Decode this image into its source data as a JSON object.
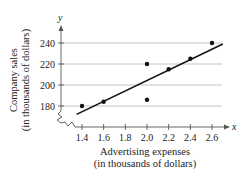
{
  "chart_data": {
    "type": "scatter",
    "title": "",
    "xlabel": "Advertising expenses",
    "xlabel_sub": "(in thousands of dollars)",
    "ylabel": "Company sales",
    "ylabel_sub": "(in thousands of dollars)",
    "x_axis_symbol": "x",
    "y_axis_symbol": "y",
    "x_ticks": [
      1.4,
      1.6,
      1.8,
      2.0,
      2.2,
      2.4,
      2.6
    ],
    "x_tick_labels": [
      "1.4",
      "1.6",
      "1.8",
      "2.0",
      "2.2",
      "2.4",
      "2.6"
    ],
    "y_ticks": [
      180,
      200,
      220,
      240
    ],
    "y_tick_labels": [
      "180",
      "200",
      "220",
      "240"
    ],
    "xlim": [
      1.2,
      2.75
    ],
    "ylim": [
      165,
      250
    ],
    "grid": "horizontal",
    "axis_break": true,
    "points": [
      {
        "x": 1.4,
        "y": 180
      },
      {
        "x": 1.6,
        "y": 184
      },
      {
        "x": 2.0,
        "y": 220
      },
      {
        "x": 2.0,
        "y": 186
      },
      {
        "x": 2.2,
        "y": 215
      },
      {
        "x": 2.4,
        "y": 225
      },
      {
        "x": 2.6,
        "y": 240
      }
    ],
    "regression_line": {
      "x1": 1.35,
      "y1": 172,
      "x2": 2.7,
      "y2": 239
    },
    "colors": {
      "points": "#111111",
      "line": "#111111",
      "grid": "#b5b5b5",
      "axis": "#555555"
    }
  }
}
